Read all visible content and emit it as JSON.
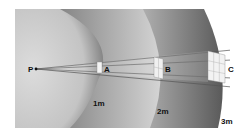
{
  "diagram": {
    "source_label": "P",
    "surfaces": [
      {
        "label": "A",
        "radius_label": "1m"
      },
      {
        "label": "B",
        "radius_label": "2m"
      },
      {
        "label": "C",
        "radius_label": "3m"
      }
    ],
    "colors": {
      "background": "#ffffff",
      "shell_light": "#d9d9d9",
      "shell_dark": "#6e6e6e",
      "grid_face": "#f2f2f2",
      "ray": "#555555"
    }
  }
}
